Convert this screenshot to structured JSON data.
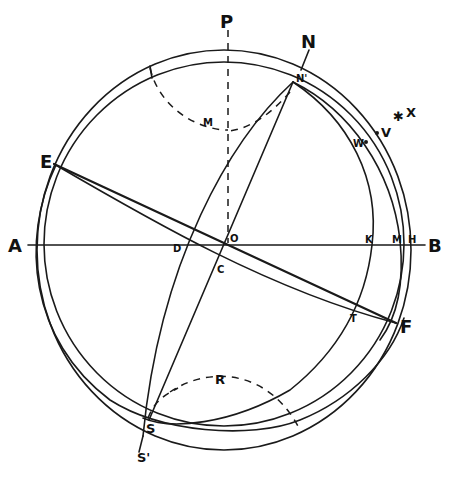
{
  "diagram": {
    "colors": {
      "ink": "#1a1a1a",
      "background": "#ffffff"
    },
    "labels": {
      "P": "P",
      "N": "N",
      "N_prime": "N'",
      "E": "E",
      "A": "A",
      "B": "B",
      "O": "O",
      "C": "C",
      "D": "D",
      "K": "K",
      "M_axis": "M",
      "H": "H",
      "F": "F",
      "T": "T",
      "S": "S",
      "S_prime": "S'",
      "R": "R",
      "M_upper": "M",
      "V": "V",
      "W": "W",
      "X": "X",
      "star": "✱"
    },
    "elements": [
      "outer circle",
      "inner circle (tilted)",
      "horizontal axis A–B through O",
      "vertical dashed axis P–O",
      "great line E–F through O",
      "curve E–T–F",
      "line N'–S through C",
      "curve N'–D–S'",
      "dashed arc M near top",
      "dashed arc R near bottom",
      "arc through K and T"
    ]
  }
}
